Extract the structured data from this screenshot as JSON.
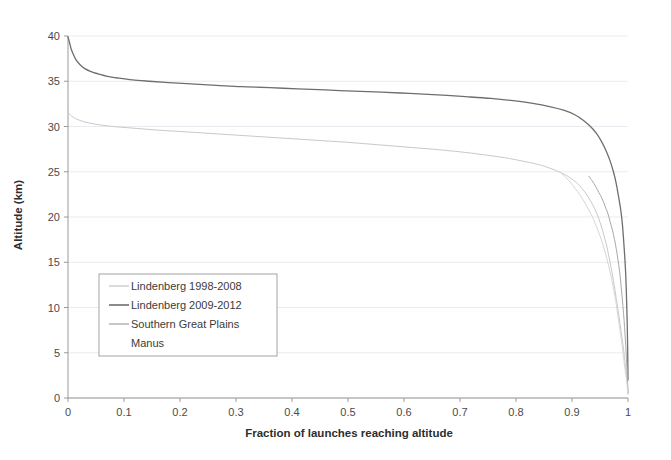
{
  "chart_data": {
    "type": "line",
    "title": "",
    "xlabel": "Fraction of launches reaching altitude",
    "ylabel": "Altitude (km)",
    "xlim": [
      0,
      1
    ],
    "ylim": [
      0,
      40
    ],
    "xticks": [
      "0",
      "0.1",
      "0.2",
      "0.3",
      "0.4",
      "0.5",
      "0.6",
      "0.7",
      "0.8",
      "0.9",
      "1"
    ],
    "xtick_values": [
      0,
      0.1,
      0.2,
      0.3,
      0.4,
      0.5,
      0.6,
      0.7,
      0.8,
      0.9,
      1
    ],
    "yticks": [
      "0",
      "5",
      "10",
      "15",
      "20",
      "25",
      "30",
      "35",
      "40"
    ],
    "ytick_values": [
      0,
      5,
      10,
      15,
      20,
      25,
      30,
      35,
      40
    ],
    "grid": true,
    "grid_axis": "y",
    "legend_position": "center-left",
    "series": [
      {
        "name": "Lindenberg 1998-2008",
        "color": "#c9c9c9",
        "width": 1.0,
        "points": [
          [
            0.0,
            31.6
          ],
          [
            0.004,
            31.3
          ],
          [
            0.01,
            31.0
          ],
          [
            0.018,
            30.75
          ],
          [
            0.03,
            30.5
          ],
          [
            0.045,
            30.3
          ],
          [
            0.06,
            30.15
          ],
          [
            0.08,
            30.0
          ],
          [
            0.1,
            29.9
          ],
          [
            0.13,
            29.75
          ],
          [
            0.16,
            29.6
          ],
          [
            0.2,
            29.45
          ],
          [
            0.25,
            29.25
          ],
          [
            0.3,
            29.05
          ],
          [
            0.35,
            28.85
          ],
          [
            0.4,
            28.65
          ],
          [
            0.45,
            28.45
          ],
          [
            0.5,
            28.25
          ],
          [
            0.55,
            28.0
          ],
          [
            0.6,
            27.75
          ],
          [
            0.65,
            27.5
          ],
          [
            0.7,
            27.2
          ],
          [
            0.74,
            26.9
          ],
          [
            0.78,
            26.55
          ],
          [
            0.81,
            26.2
          ],
          [
            0.84,
            25.8
          ],
          [
            0.86,
            25.4
          ],
          [
            0.88,
            24.9
          ],
          [
            0.895,
            24.4
          ],
          [
            0.908,
            23.8
          ],
          [
            0.92,
            23.0
          ],
          [
            0.93,
            22.1
          ],
          [
            0.94,
            21.0
          ],
          [
            0.948,
            19.8
          ],
          [
            0.955,
            18.4
          ],
          [
            0.962,
            16.8
          ],
          [
            0.968,
            15.0
          ],
          [
            0.974,
            13.0
          ],
          [
            0.979,
            11.0
          ],
          [
            0.984,
            9.0
          ],
          [
            0.988,
            7.2
          ],
          [
            0.992,
            5.4
          ],
          [
            0.995,
            3.8
          ],
          [
            0.997,
            2.6
          ],
          [
            0.999,
            1.5
          ],
          [
            1.0,
            0.6
          ]
        ]
      },
      {
        "name": "Lindenberg 2009-2012",
        "color": "#6e6e6e",
        "width": 1.3,
        "points": [
          [
            0.0,
            39.9
          ],
          [
            0.003,
            39.2
          ],
          [
            0.006,
            38.5
          ],
          [
            0.01,
            37.9
          ],
          [
            0.015,
            37.3
          ],
          [
            0.022,
            36.8
          ],
          [
            0.03,
            36.4
          ],
          [
            0.04,
            36.1
          ],
          [
            0.055,
            35.8
          ],
          [
            0.07,
            35.55
          ],
          [
            0.09,
            35.35
          ],
          [
            0.115,
            35.15
          ],
          [
            0.145,
            35.0
          ],
          [
            0.18,
            34.85
          ],
          [
            0.22,
            34.7
          ],
          [
            0.265,
            34.55
          ],
          [
            0.31,
            34.4
          ],
          [
            0.36,
            34.3
          ],
          [
            0.41,
            34.15
          ],
          [
            0.46,
            34.05
          ],
          [
            0.51,
            33.9
          ],
          [
            0.56,
            33.8
          ],
          [
            0.61,
            33.65
          ],
          [
            0.66,
            33.5
          ],
          [
            0.71,
            33.3
          ],
          [
            0.755,
            33.1
          ],
          [
            0.795,
            32.85
          ],
          [
            0.83,
            32.55
          ],
          [
            0.86,
            32.2
          ],
          [
            0.885,
            31.8
          ],
          [
            0.905,
            31.3
          ],
          [
            0.92,
            30.7
          ],
          [
            0.933,
            30.0
          ],
          [
            0.944,
            29.2
          ],
          [
            0.953,
            28.3
          ],
          [
            0.961,
            27.3
          ],
          [
            0.968,
            26.2
          ],
          [
            0.974,
            25.0
          ],
          [
            0.979,
            23.7
          ],
          [
            0.983,
            22.3
          ],
          [
            0.987,
            20.8
          ],
          [
            0.99,
            19.2
          ],
          [
            0.992,
            17.6
          ],
          [
            0.994,
            15.8
          ],
          [
            0.996,
            13.6
          ],
          [
            0.9972,
            11.4
          ],
          [
            0.9982,
            9.2
          ],
          [
            0.999,
            7.0
          ],
          [
            0.9995,
            5.0
          ],
          [
            0.9998,
            3.4
          ],
          [
            1.0,
            2.0
          ]
        ]
      },
      {
        "name": "Southern Great Plains",
        "color": "#a8a8a8",
        "width": 1.0,
        "points": [
          [
            0.93,
            24.5
          ],
          [
            0.936,
            24.0
          ],
          [
            0.942,
            23.4
          ],
          [
            0.948,
            22.7
          ],
          [
            0.954,
            22.0
          ],
          [
            0.959,
            21.2
          ],
          [
            0.964,
            20.4
          ],
          [
            0.968,
            19.5
          ],
          [
            0.972,
            18.6
          ],
          [
            0.976,
            17.5
          ],
          [
            0.979,
            16.5
          ],
          [
            0.982,
            15.3
          ],
          [
            0.985,
            14.0
          ],
          [
            0.987,
            12.8
          ],
          [
            0.989,
            11.5
          ],
          [
            0.991,
            10.1
          ],
          [
            0.993,
            8.6
          ],
          [
            0.9945,
            7.2
          ],
          [
            0.996,
            5.8
          ],
          [
            0.9972,
            4.4
          ],
          [
            0.9982,
            3.2
          ],
          [
            0.999,
            2.2
          ],
          [
            0.9996,
            1.3
          ],
          [
            1.0,
            0.5
          ]
        ]
      },
      {
        "name": "Manus",
        "color": "#d6d6d6",
        "width": 1.0,
        "points": [
          [
            0.88,
            24.9
          ],
          [
            0.89,
            24.3
          ],
          [
            0.9,
            23.6
          ],
          [
            0.91,
            22.8
          ],
          [
            0.919,
            22.0
          ],
          [
            0.927,
            21.1
          ],
          [
            0.935,
            20.2
          ],
          [
            0.942,
            19.2
          ],
          [
            0.949,
            18.1
          ],
          [
            0.955,
            17.0
          ],
          [
            0.96,
            15.9
          ],
          [
            0.965,
            14.7
          ],
          [
            0.97,
            13.4
          ],
          [
            0.974,
            12.1
          ],
          [
            0.978,
            10.8
          ],
          [
            0.981,
            9.5
          ],
          [
            0.984,
            8.2
          ],
          [
            0.987,
            6.9
          ],
          [
            0.99,
            5.6
          ],
          [
            0.992,
            4.5
          ],
          [
            0.994,
            3.5
          ],
          [
            0.996,
            2.6
          ],
          [
            0.998,
            1.7
          ],
          [
            0.999,
            1.0
          ],
          [
            1.0,
            0.4
          ]
        ]
      }
    ]
  },
  "legend": {
    "entries": [
      {
        "label": "Lindenberg 1998-2008",
        "swatch": true
      },
      {
        "label": "Lindenberg 2009-2012",
        "swatch": true
      },
      {
        "label": "Southern Great Plains",
        "swatch": true
      },
      {
        "label": "Manus",
        "swatch": false
      }
    ]
  }
}
